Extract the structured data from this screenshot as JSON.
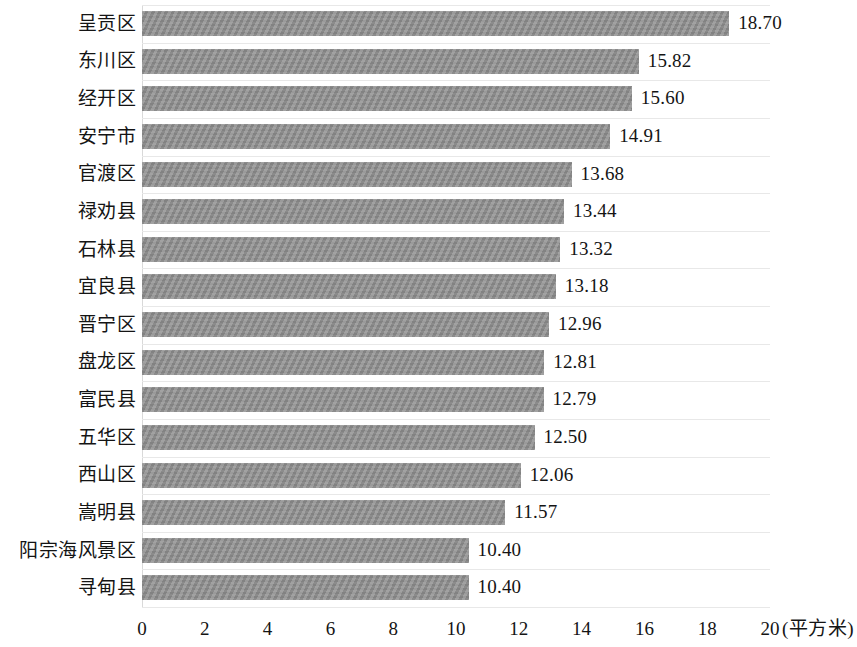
{
  "chart_data": {
    "type": "bar",
    "orientation": "horizontal",
    "title": "",
    "subtitle": "",
    "xlabel": "(平方米)",
    "ylabel": "",
    "xlim": [
      0,
      20
    ],
    "xticks": [
      0,
      2,
      4,
      6,
      8,
      10,
      12,
      14,
      16,
      18,
      20
    ],
    "xtick_labels": [
      "0",
      "2",
      "4",
      "6",
      "8",
      "10",
      "12",
      "14",
      "16",
      "18",
      "20"
    ],
    "grid": true,
    "grid_axis": "y",
    "legend": null,
    "bar_color": "#8d8d8d",
    "categories": [
      "呈贡区",
      "东川区",
      "经开区",
      "安宁市",
      "官渡区",
      "禄劝县",
      "石林县",
      "宜良县",
      "晋宁区",
      "盘龙区",
      "富民县",
      "五华区",
      "西山区",
      "嵩明县",
      "阳宗海风景区",
      "寻甸县"
    ],
    "values": [
      18.7,
      15.82,
      15.6,
      14.91,
      13.68,
      13.44,
      13.32,
      13.18,
      12.96,
      12.81,
      12.79,
      12.5,
      12.06,
      11.57,
      10.4,
      10.4
    ],
    "value_labels": [
      "18.70",
      "15.82",
      "15.60",
      "14.91",
      "13.68",
      "13.44",
      "13.32",
      "13.18",
      "12.96",
      "12.81",
      "12.79",
      "12.50",
      "12.06",
      "11.57",
      "10.40",
      "10.40"
    ],
    "unit": "平方米"
  }
}
